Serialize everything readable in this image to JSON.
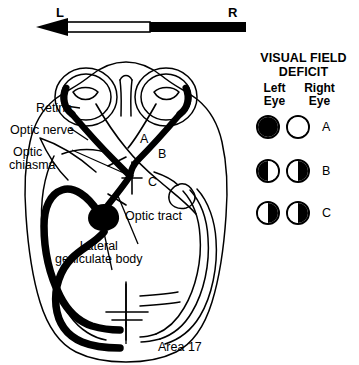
{
  "orientation": {
    "name": "left-right-visual-field-axis",
    "left_label": "L",
    "right_label": "R",
    "arrow_direction": "left",
    "segments": [
      {
        "name": "left-half-field",
        "fill": "#ffffff"
      },
      {
        "name": "right-half-field",
        "fill": "#000000"
      }
    ]
  },
  "diagram": {
    "labels": {
      "retina": "Retina",
      "optic_nerve": "Optic nerve",
      "optic_chiasma_line1": "Optic",
      "optic_chiasma_line2": "chiasma",
      "optic_tract": "Optic tract",
      "lgb_line1": "Lateral",
      "lgb_line2": "geniculate body",
      "area17": "Area 17"
    },
    "lesion_markers": [
      {
        "id": "A",
        "label": "A",
        "site": "optic-nerve"
      },
      {
        "id": "B",
        "label": "B",
        "site": "optic-chiasma"
      },
      {
        "id": "C",
        "label": "C",
        "site": "optic-tract"
      }
    ]
  },
  "legend": {
    "title_line1": "VISUAL FIELD",
    "title_line2": "DEFICIT",
    "columns": [
      {
        "line1": "Left",
        "line2": "Eye"
      },
      {
        "line1": "Right",
        "line2": "Eye"
      }
    ],
    "rows": [
      {
        "letter": "A",
        "left_eye": {
          "left_half": "#000000",
          "right_half": "#000000"
        },
        "right_eye": {
          "left_half": "#ffffff",
          "right_half": "#ffffff"
        }
      },
      {
        "letter": "B",
        "left_eye": {
          "left_half": "#000000",
          "right_half": "#ffffff"
        },
        "right_eye": {
          "left_half": "#ffffff",
          "right_half": "#000000"
        }
      },
      {
        "letter": "C",
        "left_eye": {
          "left_half": "#ffffff",
          "right_half": "#000000"
        },
        "right_eye": {
          "left_half": "#ffffff",
          "right_half": "#000000"
        }
      }
    ]
  },
  "colors": {
    "ink": "#000000",
    "paper": "#ffffff"
  }
}
